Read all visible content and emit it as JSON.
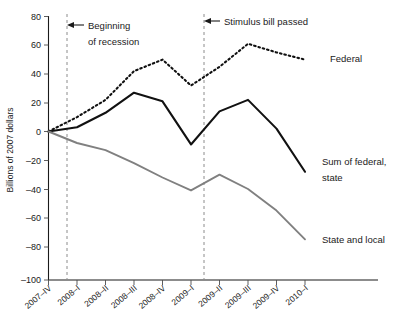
{
  "chart_data": {
    "type": "line",
    "title": "",
    "xlabel": "",
    "ylabel": "Billions of 2007 dollars",
    "ylim": [
      -100,
      80
    ],
    "yticks": [
      80,
      60,
      40,
      20,
      0,
      -20,
      -40,
      -60,
      -80,
      -100
    ],
    "ytick_labels": [
      "80",
      "60",
      "40",
      "20",
      "0",
      "–20",
      "–40",
      "–60",
      "–80",
      "–100"
    ],
    "grid": false,
    "legend_position": "inline-right",
    "categories": [
      "2007–IV",
      "2008–I",
      "2008–II",
      "2008–III",
      "2008–IV",
      "2009–I",
      "2009–II",
      "2009–III",
      "2009–IV",
      "2010–I"
    ],
    "xtick_labels": [
      "2007–IV",
      "2008–I",
      "2008–II",
      "2008–III",
      "2008–IV",
      "2009–I",
      "2009–II",
      "2009–III",
      "2009–IV",
      "2010–I"
    ],
    "series": [
      {
        "name": "Federal",
        "label": "Federal",
        "style": "dotted",
        "color": "#111111",
        "values": [
          0,
          10,
          22,
          42,
          50,
          32,
          45,
          61,
          55,
          50
        ]
      },
      {
        "name": "Sum of federal, state and local",
        "label_line1": "Sum of federal,",
        "label_line2": "state",
        "style": "solid",
        "color": "#111111",
        "values": [
          0,
          3,
          13,
          27,
          21,
          -9,
          14,
          22,
          2,
          -28
        ]
      },
      {
        "name": "State and local",
        "label": "State and local",
        "style": "solid",
        "color": "#808080",
        "values": [
          0,
          -8,
          -13,
          -22,
          -32,
          -41,
          -30,
          -40,
          -55,
          -75
        ]
      }
    ],
    "annotations": [
      {
        "id": "recession",
        "line1": "Beginning",
        "line2": "of recession",
        "at_category": "2008–I",
        "marker": "dashed-vertical-line-with-arrow"
      },
      {
        "id": "stimulus",
        "line1": "Stimulus bill passed",
        "line2": "",
        "at_category": "2009–I",
        "marker": "dashed-vertical-line-with-arrow"
      }
    ]
  }
}
